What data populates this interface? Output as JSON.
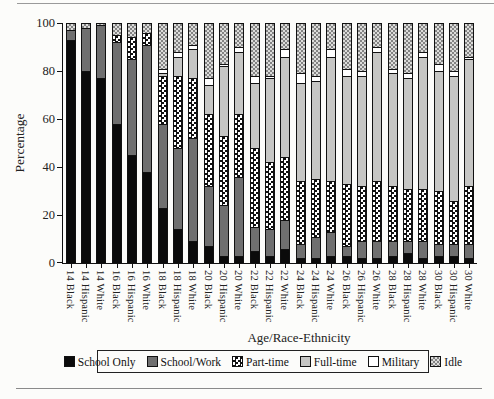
{
  "chart_data": {
    "type": "bar",
    "stacked": true,
    "title": "",
    "xlabel": "Age/Race-Ethnicity",
    "ylabel": "Percentage",
    "ylim": [
      0,
      100
    ],
    "yticks": [
      0,
      20,
      40,
      60,
      80,
      100
    ],
    "grid": false,
    "legend_position": "bottom",
    "categories": [
      "14 Black",
      "14 Hispanic",
      "14 White",
      "16 Black",
      "16 Hispanic",
      "16 White",
      "18 Black",
      "18 Hispanic",
      "18 White",
      "20 Black",
      "20 Hispanic",
      "20 White",
      "22 Black",
      "22 Hispanic",
      "22 White",
      "24 Black",
      "24 Hispanic",
      "24 White",
      "26 Black",
      "26 Hispanic",
      "26 White",
      "28 Black",
      "28 Hispanic",
      "28 White",
      "30 Black",
      "30 Hispanic",
      "30 White"
    ],
    "series": [
      {
        "name": "School Only",
        "pattern": "solid-black",
        "color": "#0b0b0b",
        "values": [
          93,
          80,
          77,
          58,
          45,
          38,
          23,
          14,
          9,
          7,
          3,
          3,
          5,
          3,
          6,
          2,
          2,
          3,
          3,
          2,
          2,
          3,
          4,
          2,
          3,
          3,
          2
        ]
      },
      {
        "name": "School/Work",
        "pattern": "dark-gray",
        "color": "#6f6f6f",
        "values": [
          4,
          18,
          22,
          34,
          40,
          53,
          35,
          34,
          43,
          25,
          21,
          33,
          10,
          11,
          12,
          6,
          9,
          10,
          4,
          7,
          7,
          6,
          5,
          7,
          5,
          5,
          6
        ]
      },
      {
        "name": "Part-time",
        "pattern": "bw-checker",
        "color": "#101010 on #ffffff checker",
        "values": [
          0,
          0,
          0,
          3,
          9,
          5,
          20,
          30,
          25,
          30,
          29,
          26,
          33,
          28,
          26,
          26,
          24,
          21,
          26,
          23,
          25,
          23,
          22,
          22,
          22,
          18,
          24
        ]
      },
      {
        "name": "Full-time",
        "pattern": "light-gray",
        "color": "#c6c6c4",
        "values": [
          0,
          0,
          0,
          0,
          0,
          0,
          1,
          8,
          12,
          12,
          29,
          26,
          27,
          35,
          42,
          41,
          41,
          52,
          45,
          46,
          54,
          47,
          46,
          55,
          50,
          52,
          53
        ]
      },
      {
        "name": "Military",
        "pattern": "white",
        "color": "#ffffff",
        "values": [
          0,
          0,
          0,
          0,
          0,
          0,
          2,
          2,
          2,
          3,
          1,
          2,
          3,
          1,
          3,
          4,
          2,
          3,
          3,
          2,
          2,
          2,
          2,
          2,
          3,
          2,
          1
        ]
      },
      {
        "name": "Idle",
        "pattern": "gray-checker",
        "color": "#838383 on #dcdcda checker",
        "values": [
          3,
          2,
          1,
          5,
          6,
          4,
          19,
          12,
          9,
          23,
          17,
          10,
          22,
          22,
          11,
          21,
          22,
          11,
          19,
          20,
          10,
          19,
          21,
          12,
          17,
          20,
          14
        ]
      }
    ]
  }
}
